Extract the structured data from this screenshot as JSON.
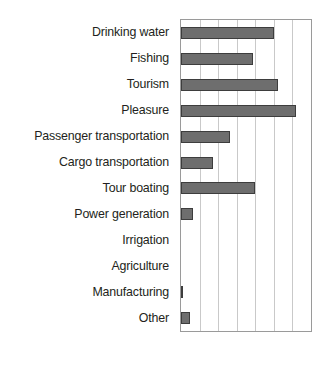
{
  "chart_data": {
    "type": "bar",
    "orientation": "horizontal",
    "title": "",
    "subtitle": "",
    "xlabel": "",
    "ylabel": "",
    "categories": [
      "Drinking water",
      "Fishing",
      "Tourism",
      "Pleasure",
      "Passenger transportation",
      "Cargo transportation",
      "Tour boating",
      "Power generation",
      "Irrigation",
      "Agriculture",
      "Manufacturing",
      "Other"
    ],
    "values": [
      5.0,
      3.9,
      5.2,
      6.2,
      2.65,
      1.7,
      4.0,
      0.63,
      0.0,
      0.0,
      0.1,
      0.48
    ],
    "xlim": [
      0,
      7
    ],
    "ylim": null,
    "xticks": [
      0,
      1,
      2,
      3,
      4,
      5,
      6,
      7
    ],
    "xticklabels": [
      "",
      "",
      "",
      "",
      "",
      "",
      "",
      ""
    ],
    "grid": "vertical",
    "legend": null,
    "legend_position": "none",
    "annotations": [],
    "bar_color": "#6e6e6e",
    "bar_edge_color": "#3d3d3d",
    "grid_color": "#c9c9c9",
    "frame_color": "#9a9a9a",
    "background_color": "#ffffff",
    "text_color": "#231f20"
  }
}
